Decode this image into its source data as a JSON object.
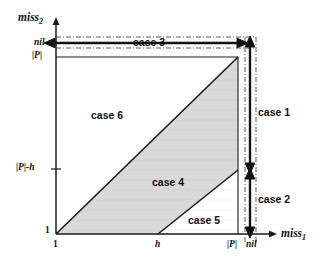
{
  "figure": {
    "type": "diagram",
    "background_color": "#ffffff",
    "shade_color": "#d9d9d9",
    "line_color": "#1a1a1a"
  },
  "axes": {
    "x": {
      "name": "miss",
      "subscript": "1",
      "ticks": [
        {
          "label": "1",
          "italic": false
        },
        {
          "label": "h",
          "italic": true
        },
        {
          "label": "|P|",
          "italic": true
        },
        {
          "label": "nil",
          "italic": true
        }
      ]
    },
    "y": {
      "name": "miss",
      "subscript": "2",
      "ticks": [
        {
          "label": "1",
          "italic": false
        },
        {
          "label": "|P|-h",
          "italic": true
        },
        {
          "label": "|P|",
          "italic": true
        },
        {
          "label": "nil",
          "italic": true
        }
      ]
    }
  },
  "regions": [
    {
      "id": "case1",
      "label": "case 1",
      "kind": "vertical-arrow-range"
    },
    {
      "id": "case2",
      "label": "case 2",
      "kind": "vertical-arrow-range"
    },
    {
      "id": "case3",
      "label": "case 3",
      "kind": "horizontal-arrow-range"
    },
    {
      "id": "case4",
      "label": "case 4",
      "kind": "shaded-band"
    },
    {
      "id": "case5",
      "label": "case 5",
      "kind": "lower-triangle"
    },
    {
      "id": "case6",
      "label": "case 6",
      "kind": "upper-triangle"
    }
  ]
}
